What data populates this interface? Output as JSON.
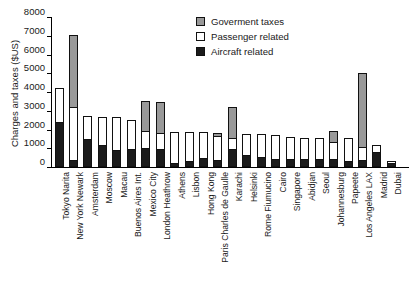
{
  "chart_data": {
    "type": "bar",
    "title": "",
    "xlabel": "",
    "ylabel": "Charges and taxes ($US)",
    "ylim": [
      0,
      8000
    ],
    "yticks": [
      0,
      1000,
      2000,
      3000,
      4000,
      5000,
      6000,
      7000,
      8000
    ],
    "ytick_labels": [
      "0",
      "1000",
      "2000",
      "3000",
      "4000",
      "5000",
      "6000",
      "7000",
      "8000"
    ],
    "grid": false,
    "stacked": true,
    "legend_position": "top-right",
    "legend": [
      "Goverment taxes",
      "Passenger related",
      "Aircraft related"
    ],
    "colors": {
      "government": "#999999",
      "passenger": "#ffffff",
      "aircraft": "#1b1b1b",
      "outline": "#111111"
    },
    "categories": [
      "Tokyo Narita",
      "New York Newark",
      "Amsterdam",
      "Moscow",
      "Macau",
      "Buenos Aires Int.",
      "Mexico City",
      "London Heathrow",
      "Athens",
      "Lisbon",
      "Hong Kong",
      "Paris Charles de Gaulle",
      "Karachi",
      "Helsinki",
      "Rome Fiumucino",
      "Cairo",
      "Singapore",
      "Abidjan",
      "Seoul",
      "Johannesburg",
      "Papeete",
      "Los Angeles LAX",
      "Madrid",
      "Dubai"
    ],
    "series": [
      {
        "name": "Aircraft related",
        "values": [
          2400,
          380,
          1500,
          1150,
          900,
          950,
          1000,
          950,
          230,
          300,
          480,
          400,
          950,
          620,
          560,
          420,
          430,
          440,
          430,
          420,
          330,
          350,
          820,
          230
        ]
      },
      {
        "name": "Passenger related",
        "values": [
          1800,
          2820,
          1200,
          1500,
          1750,
          1550,
          900,
          880,
          1620,
          1550,
          1370,
          1280,
          600,
          1130,
          1180,
          1280,
          1190,
          1130,
          1100,
          900,
          1200,
          700,
          340,
          100
        ]
      },
      {
        "name": "Goverment taxes",
        "values": [
          0,
          3850,
          0,
          0,
          0,
          0,
          1600,
          1620,
          0,
          0,
          0,
          120,
          1650,
          0,
          0,
          0,
          0,
          0,
          0,
          580,
          0,
          3950,
          0,
          0
        ]
      }
    ],
    "totals": [
      4200,
      7050,
      2700,
      2650,
      2650,
      2500,
      3500,
      3450,
      1850,
      1850,
      1850,
      1800,
      3200,
      1750,
      1740,
      1700,
      1620,
      1570,
      1530,
      1900,
      1530,
      5000,
      1160,
      330
    ]
  },
  "caption": ""
}
